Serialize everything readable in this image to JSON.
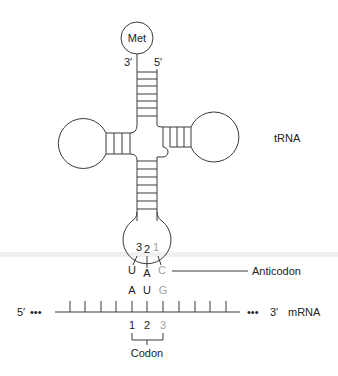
{
  "diagram": {
    "molecule_label": "tRNA",
    "amino_acid": "Met",
    "acceptor_stem": {
      "end_3": "3′",
      "end_5": "5′"
    },
    "anticodon": {
      "label": "Anticodon",
      "position_numbers": [
        "3",
        "2",
        "1"
      ],
      "bases": [
        "U",
        "A",
        "C"
      ]
    },
    "mrna": {
      "label": "mRNA",
      "end_5": "5′",
      "end_3": "3′",
      "ellipsis_left": "•••",
      "ellipsis_right": "•••",
      "codon_bases": [
        "A",
        "U",
        "G"
      ],
      "codon_positions": [
        "1",
        "2",
        "3"
      ],
      "codon_label": "Codon"
    },
    "colors": {
      "line": "#3a3a3a",
      "text": "#222222",
      "wobble_gray": "#a0a0a0"
    }
  }
}
